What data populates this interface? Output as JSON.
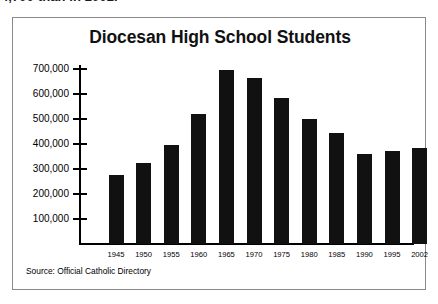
{
  "page": {
    "truncated_text_above": "4,700 than in 2002."
  },
  "figure": {
    "title": "Diocesan High School Students",
    "source_note": "Source: Official Catholic Directory"
  },
  "chart_data": {
    "type": "bar",
    "title": "Diocesan High School Students",
    "xlabel": "",
    "ylabel": "",
    "categories": [
      "1945",
      "1950",
      "1955",
      "1960",
      "1965",
      "1970",
      "1975",
      "1980",
      "1985",
      "1990",
      "1995",
      "2002"
    ],
    "values": [
      276000,
      324000,
      396000,
      520000,
      696000,
      664000,
      586000,
      502000,
      444000,
      360000,
      374000,
      384000
    ],
    "ylim": [
      0,
      740000
    ],
    "yticks": [
      100000,
      200000,
      300000,
      400000,
      500000,
      600000,
      700000
    ],
    "ytick_labels": [
      "100,000",
      "200,000",
      "300,000",
      "400,000",
      "500,000",
      "600,000",
      "700,000"
    ],
    "grid": false,
    "legend": false,
    "bar_color": "#111111",
    "source": "Official Catholic Directory"
  }
}
